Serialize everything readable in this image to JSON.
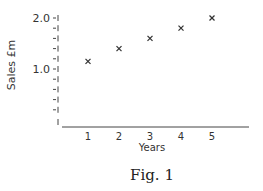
{
  "chart_data": {
    "type": "scatter",
    "title": "",
    "caption": "Fig. 1",
    "xlabel": "Years",
    "ylabel": "Sales £m",
    "x": [
      1,
      2,
      3,
      4,
      5
    ],
    "series": [
      {
        "name": "Sales",
        "marker": "x",
        "values": [
          1.15,
          1.4,
          1.6,
          1.8,
          2.0
        ]
      }
    ],
    "x_ticks": [
      "1",
      "2",
      "3",
      "4",
      "5"
    ],
    "y_tick_labels": [
      {
        "value": 2.0,
        "label": "2.0"
      },
      {
        "value": 1.0,
        "label": "1.0"
      }
    ],
    "y_minor_tick_step": 0.2,
    "ylim": [
      0.2,
      2.0
    ],
    "xlim": [
      0,
      6
    ],
    "y_axis_broken": true,
    "grid": false,
    "legend": "none"
  }
}
